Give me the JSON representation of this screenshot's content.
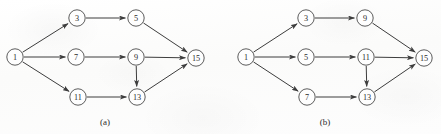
{
  "figure": {
    "width": 441,
    "height": 134,
    "background_color": "#fdfdfc",
    "stroke_color": "#3d3d3d",
    "node_fill_color": "#fefefe",
    "label_color": "#2b2b2b"
  },
  "panels": [
    {
      "id": "panel-a",
      "caption": "(a)",
      "caption_position": {
        "x": 105,
        "y": 122
      },
      "node_radius": 8.2,
      "nodes": [
        {
          "id": "a1",
          "label": "1",
          "x": 15,
          "y": 57
        },
        {
          "id": "a3",
          "label": "3",
          "x": 77,
          "y": 18
        },
        {
          "id": "a5",
          "label": "5",
          "x": 136,
          "y": 18
        },
        {
          "id": "a7",
          "label": "7",
          "x": 76,
          "y": 57
        },
        {
          "id": "a9",
          "label": "9",
          "x": 136,
          "y": 57
        },
        {
          "id": "a11",
          "label": "11",
          "x": 78,
          "y": 97
        },
        {
          "id": "a13",
          "label": "13",
          "x": 137,
          "y": 97
        },
        {
          "id": "a15",
          "label": "15",
          "x": 196,
          "y": 58
        }
      ],
      "edges": [
        {
          "from": "a1",
          "to": "a3"
        },
        {
          "from": "a1",
          "to": "a7"
        },
        {
          "from": "a1",
          "to": "a11"
        },
        {
          "from": "a3",
          "to": "a5"
        },
        {
          "from": "a5",
          "to": "a15"
        },
        {
          "from": "a7",
          "to": "a9"
        },
        {
          "from": "a9",
          "to": "a15"
        },
        {
          "from": "a9",
          "to": "a13"
        },
        {
          "from": "a11",
          "to": "a13"
        },
        {
          "from": "a13",
          "to": "a15"
        }
      ]
    },
    {
      "id": "panel-b",
      "caption": "(b)",
      "caption_position": {
        "x": 325,
        "y": 122
      },
      "node_radius": 8.2,
      "nodes": [
        {
          "id": "b1",
          "label": "1",
          "x": 246,
          "y": 57
        },
        {
          "id": "b3",
          "label": "3",
          "x": 306,
          "y": 18
        },
        {
          "id": "b9",
          "label": "9",
          "x": 365,
          "y": 18
        },
        {
          "id": "b5",
          "label": "5",
          "x": 306,
          "y": 57
        },
        {
          "id": "b11",
          "label": "11",
          "x": 366,
          "y": 57
        },
        {
          "id": "b7",
          "label": "7",
          "x": 307,
          "y": 97
        },
        {
          "id": "b13",
          "label": "13",
          "x": 367,
          "y": 97
        },
        {
          "id": "b15",
          "label": "15",
          "x": 424,
          "y": 58
        }
      ],
      "edges": [
        {
          "from": "b1",
          "to": "b3"
        },
        {
          "from": "b1",
          "to": "b5"
        },
        {
          "from": "b1",
          "to": "b7"
        },
        {
          "from": "b3",
          "to": "b9"
        },
        {
          "from": "b9",
          "to": "b15"
        },
        {
          "from": "b5",
          "to": "b11"
        },
        {
          "from": "b11",
          "to": "b15"
        },
        {
          "from": "b11",
          "to": "b13"
        },
        {
          "from": "b7",
          "to": "b13"
        },
        {
          "from": "b13",
          "to": "b15"
        }
      ]
    }
  ]
}
